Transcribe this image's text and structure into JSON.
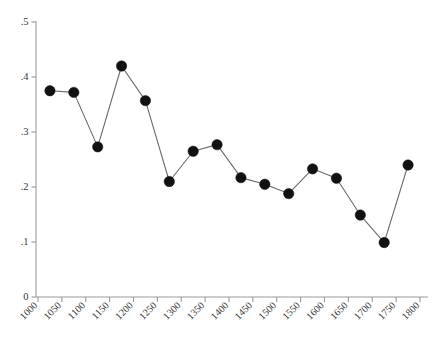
{
  "figure": {
    "background_color": "#ffffff",
    "axis_color": "#9a9a9a",
    "line_color": "#6b6b6b",
    "marker_color": "#111111",
    "caption_fragment": ""
  },
  "chart_data": {
    "type": "line",
    "title": "",
    "subtitle": "",
    "xlabel": "",
    "ylabel": "",
    "xlim": [
      1000,
      1800
    ],
    "ylim": [
      0,
      0.5
    ],
    "grid": false,
    "legend": null,
    "legend_position": "none",
    "xticks": [
      1000,
      1050,
      1100,
      1150,
      1200,
      1250,
      1300,
      1350,
      1400,
      1450,
      1500,
      1550,
      1600,
      1650,
      1700,
      1750,
      1800
    ],
    "xtick_labels": [
      "1000",
      "1050",
      "1100",
      "1150",
      "1200",
      "1250",
      "1300",
      "1350",
      "1400",
      "1450",
      "1500",
      "1550",
      "1600",
      "1650",
      "1700",
      "1750",
      "1800"
    ],
    "yticks": [
      0,
      0.1,
      0.2,
      0.3,
      0.4,
      0.5
    ],
    "ytick_labels": [
      "0",
      ".1",
      ".2",
      ".3",
      ".4",
      ".5"
    ],
    "x": [
      1025,
      1075,
      1125,
      1175,
      1225,
      1275,
      1325,
      1375,
      1425,
      1475,
      1525,
      1575,
      1625,
      1675,
      1725,
      1775
    ],
    "values": [
      0.375,
      0.372,
      0.273,
      0.42,
      0.357,
      0.21,
      0.265,
      0.277,
      0.217,
      0.205,
      0.188,
      0.233,
      0.216,
      0.149,
      0.099,
      0.24
    ],
    "marker": "circle",
    "marker_size": 5.2,
    "annotations": []
  }
}
